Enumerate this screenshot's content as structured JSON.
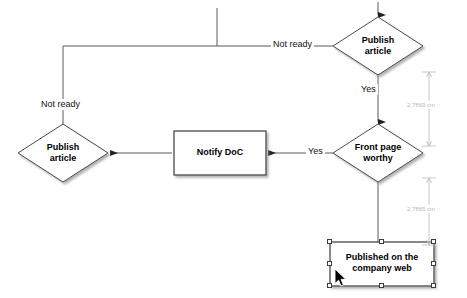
{
  "diagram": {
    "type": "flowchart",
    "nodes": [
      {
        "id": "publish-article-top",
        "shape": "diamond",
        "label": "Publish\narticle",
        "x": 333,
        "y": 17,
        "width": 90,
        "height": 58,
        "selected": false
      },
      {
        "id": "front-page-worthy",
        "shape": "diamond",
        "label": "Front page\nworthy",
        "x": 333,
        "y": 124,
        "width": 90,
        "height": 58,
        "selected": false
      },
      {
        "id": "notify-doc",
        "shape": "rectangle",
        "label": "Notify DoC",
        "x": 174,
        "y": 131,
        "width": 92,
        "height": 44,
        "selected": false
      },
      {
        "id": "publish-article-left",
        "shape": "diamond",
        "label": "Publish\narticle",
        "x": 18,
        "y": 124,
        "width": 90,
        "height": 58,
        "selected": false
      },
      {
        "id": "published-on-company-web",
        "shape": "rectangle",
        "label": "Published on the\ncompany web",
        "x": 330,
        "y": 242,
        "width": 104,
        "height": 44,
        "selected": true
      }
    ],
    "edge_labels": [
      {
        "id": "not-ready-top",
        "text": "Not ready",
        "x": 271,
        "y": 39
      },
      {
        "id": "yes-vertical",
        "text": "Yes",
        "x": 359,
        "y": 84
      },
      {
        "id": "not-ready-left",
        "text": "Not ready",
        "x": 39,
        "y": 99
      },
      {
        "id": "yes-horizontal",
        "text": "Yes",
        "x": 306,
        "y": 146
      }
    ],
    "dimensions": [
      {
        "id": "dimension-upper",
        "text": "2,7869 cm",
        "x": 406,
        "y": 101,
        "line_x": 429,
        "y1": 72,
        "y2": 146
      },
      {
        "id": "dimension-lower",
        "text": "2,7865 cm",
        "x": 406,
        "y": 205,
        "line_x": 429,
        "y1": 178,
        "y2": 245
      }
    ],
    "colors": {
      "stroke": "#4a4a4a",
      "fill": "#ffffff",
      "shadow": "#b0b0b0",
      "text": "#000000",
      "dimension": "#b9b9b9",
      "handle_border": "#3b3b3b",
      "handle_fill": "#ffffff",
      "selection_outline": "#777777"
    }
  }
}
